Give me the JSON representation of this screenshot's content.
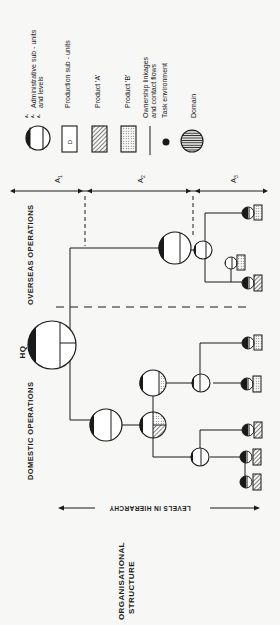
{
  "figure": {
    "title_line1": "ORGANISATIONAL",
    "title_line2": "STRUCTURE",
    "axis_label": "LEVELS IN HIERARCHY",
    "orientation": "rotated 90 degrees counter-clockwise"
  },
  "sections": {
    "hq": "HQ",
    "domestic": "DOMESTIC OPERATIONS",
    "overseas": "OVERSEAS OPERATIONS"
  },
  "levels": [
    {
      "id": "A1",
      "label": "A",
      "sub": "1"
    },
    {
      "id": "A2",
      "label": "A",
      "sub": "2"
    },
    {
      "id": "A3",
      "label": "A",
      "sub": "3"
    }
  ],
  "legend": {
    "items": [
      {
        "symbol": "admin-subunit-circle",
        "label": "Administrative sub - units",
        "label2": "and levels",
        "level_marks": [
          "A3",
          "A2",
          "A1"
        ]
      },
      {
        "symbol": "production-subunit-box",
        "label": "Production sub - units",
        "box_letter": "D"
      },
      {
        "symbol": "product-a-hatched",
        "label": "Product 'A'"
      },
      {
        "symbol": "product-b-dotted",
        "label": "Product 'B'"
      },
      {
        "symbol": "linkage-line",
        "label": "Ownership linkages",
        "label2": "and contact flows"
      },
      {
        "symbol": "task-env-dot",
        "label": "Task environment"
      },
      {
        "symbol": "domain-circle",
        "label": "Domain"
      }
    ]
  },
  "tree": {
    "hq": {
      "name": "HQ"
    },
    "overseas": {
      "admin": "A2 overseas unit",
      "sub": "A3 overseas unit",
      "leaves": [
        {
          "product": "B"
        },
        {
          "product": "B"
        },
        {
          "product": "A"
        }
      ]
    },
    "domestic": {
      "admin": "A2 domestic unit",
      "children": [
        {
          "type": "mixed A/B unit",
          "leaves": [
            {
              "product": "A"
            },
            {
              "product": "A"
            },
            {
              "product": "A"
            }
          ]
        },
        {
          "type": "product B unit",
          "leaves": [
            {
              "product": "B"
            },
            {
              "product": "B"
            }
          ]
        }
      ]
    }
  },
  "colors": {
    "ink": "#1a1a1a",
    "paper": "#f7f7f5"
  }
}
